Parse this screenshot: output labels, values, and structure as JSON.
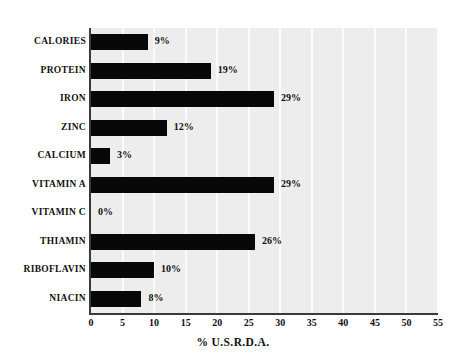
{
  "chart_data": {
    "type": "bar",
    "orientation": "horizontal",
    "title": "",
    "subtitle": "",
    "xlabel": "% U.S.R.D.A.",
    "ylabel": "",
    "xlim": [
      0,
      55
    ],
    "xticks": [
      0,
      5,
      10,
      15,
      20,
      25,
      30,
      35,
      40,
      45,
      50,
      55
    ],
    "xtick_labels": [
      "0",
      "5",
      "10",
      "15",
      "20",
      "25",
      "30",
      "35",
      "40",
      "45",
      "50",
      "55"
    ],
    "grid": "vertical-white-gridlines-every-5",
    "legend": "none",
    "categories": [
      "CALORIES",
      "PROTEIN",
      "IRON",
      "ZINC",
      "CALCIUM",
      "VITAMIN A",
      "VITAMIN C",
      "THIAMIN",
      "RIBOFLAVIN",
      "NIACIN"
    ],
    "values": [
      9,
      19,
      29,
      12,
      3,
      29,
      0,
      26,
      10,
      8
    ],
    "value_labels": [
      "9%",
      "19%",
      "29%",
      "12%",
      "3%",
      "29%",
      "0%",
      "26%",
      "10%",
      "8%"
    ],
    "bars": [
      {
        "category": "CALORIES",
        "value": 9,
        "label": "9%"
      },
      {
        "category": "PROTEIN",
        "value": 19,
        "label": "19%"
      },
      {
        "category": "IRON",
        "value": 29,
        "label": "29%"
      },
      {
        "category": "ZINC",
        "value": 12,
        "label": "12%"
      },
      {
        "category": "CALCIUM",
        "value": 3,
        "label": "3%"
      },
      {
        "category": "VITAMIN A",
        "value": 29,
        "label": "29%"
      },
      {
        "category": "VITAMIN C",
        "value": 0,
        "label": "0%"
      },
      {
        "category": "THIAMIN",
        "value": 26,
        "label": "26%"
      },
      {
        "category": "RIBOFLAVIN",
        "value": 10,
        "label": "10%"
      },
      {
        "category": "NIACIN",
        "value": 8,
        "label": "8%"
      }
    ],
    "colors": {
      "bar": "#080808",
      "plot_background": "#ededed",
      "gridline": "#fcfcfc",
      "axis": "#3a3a3a",
      "text": "#111111",
      "page_background": "#ffffff"
    }
  }
}
